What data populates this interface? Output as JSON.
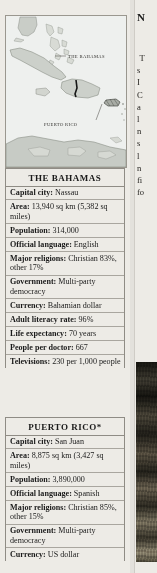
{
  "map": {
    "caption_labels": [
      {
        "text": "THE BAHAMAS",
        "x": 62,
        "y": 42
      },
      {
        "text": "PUERTO RICO",
        "x": 46,
        "y": 108
      }
    ]
  },
  "tables": [
    {
      "id": "bahamas",
      "title": "THE BAHAMAS",
      "rows": [
        {
          "key": "Capital city:",
          "value": "Nassau"
        },
        {
          "key": "Area:",
          "value": "13,940 sq km (5,382 sq miles)"
        },
        {
          "key": "Population:",
          "value": "314,000"
        },
        {
          "key": "Official language:",
          "value": "English"
        },
        {
          "key": "Major religions:",
          "value": "Christian 83%, other 17%"
        },
        {
          "key": "Government:",
          "value": "Multi-party democracy"
        },
        {
          "key": "Currency:",
          "value": "Bahamian dollar"
        },
        {
          "key": "Adult literacy rate:",
          "value": "96%"
        },
        {
          "key": "Life expectancy:",
          "value": "70 years"
        },
        {
          "key": "People per doctor:",
          "value": "667"
        },
        {
          "key": "Televisions:",
          "value": "230 per 1,000 people"
        }
      ]
    },
    {
      "id": "puertorico",
      "title": "PUERTO RICO*",
      "rows": [
        {
          "key": "Capital city:",
          "value": "San Juan"
        },
        {
          "key": "Area:",
          "value": "8,875 sq km (3,427 sq miles)"
        },
        {
          "key": "Population:",
          "value": "3,890,000"
        },
        {
          "key": "Official language:",
          "value": "Spanish"
        },
        {
          "key": "Major religions:",
          "value": "Christian 85%, other 15%"
        },
        {
          "key": "Government:",
          "value": "Multi-party democracy"
        },
        {
          "key": "Currency:",
          "value": "US dollar"
        }
      ]
    }
  ],
  "right_column": {
    "heading_fragment": "N",
    "text_line_fragments": [
      "T",
      "s",
      "I",
      "C",
      "a",
      "l",
      "n",
      "s",
      "l",
      "n",
      "fi",
      "fo"
    ],
    "photo_name": "photograph"
  }
}
